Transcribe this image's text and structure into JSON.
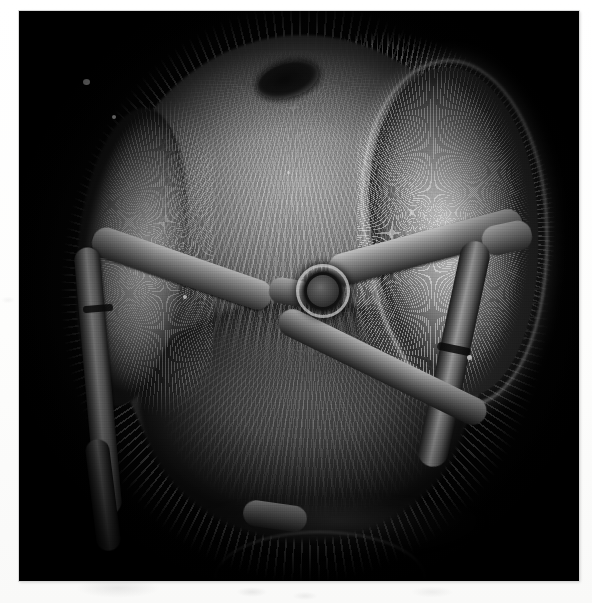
{
  "document": {
    "type": "scanning-electron-micrograph",
    "orientation": "portrait",
    "background_color": "#fdfdfd",
    "plate_background_color": "#040404",
    "caption": "",
    "title": "",
    "scale_bar_text": "",
    "magnification_text": "",
    "annotation_text": ""
  },
  "plate": {
    "subject": "honey bee head, frontal view",
    "rendering": "grayscale",
    "border_color": "#d9d9d9",
    "left": 19,
    "top": 11,
    "width": 560,
    "height": 570
  },
  "features": [
    {
      "name": "median-ocellus",
      "label": ""
    },
    {
      "name": "compound-eye-right",
      "label": ""
    },
    {
      "name": "compound-eye-left",
      "label": ""
    },
    {
      "name": "antennal-socket",
      "label": ""
    },
    {
      "name": "antenna-left-scape",
      "label": ""
    },
    {
      "name": "antenna-left-pedicel",
      "label": ""
    },
    {
      "name": "antenna-left-flagellum",
      "label": ""
    },
    {
      "name": "antenna-right-scape",
      "label": ""
    },
    {
      "name": "antenna-right-pedicel",
      "label": ""
    },
    {
      "name": "antenna-right-flagellum",
      "label": ""
    },
    {
      "name": "clypeus",
      "label": ""
    },
    {
      "name": "mouthparts",
      "label": ""
    },
    {
      "name": "frons-setae",
      "label": ""
    }
  ],
  "palette": {
    "paper": "#fdfdfd",
    "field_black": "#040404",
    "highlight": "#e8e8e8",
    "midtone": "#707070",
    "shadow": "#1b1b1b"
  }
}
